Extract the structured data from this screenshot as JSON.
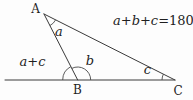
{
  "diagram": {
    "equation": {
      "lhs": "a+b+c=",
      "rhs": "180°"
    },
    "vertices": [
      {
        "id": "A",
        "label": "A"
      },
      {
        "id": "B",
        "label": "B"
      },
      {
        "id": "C",
        "label": "C"
      }
    ],
    "angles": [
      {
        "id": "a",
        "label": "a",
        "at": "A"
      },
      {
        "id": "b",
        "label": "b",
        "at": "B"
      },
      {
        "id": "c",
        "label": "c",
        "at": "C"
      },
      {
        "id": "exterior",
        "label": "a+c",
        "at": "B"
      }
    ],
    "colors": {
      "line": "#3a3a3a",
      "arc": "#4a4a4a",
      "text": "#1f1f1f",
      "background": "#fdfdfd"
    }
  }
}
